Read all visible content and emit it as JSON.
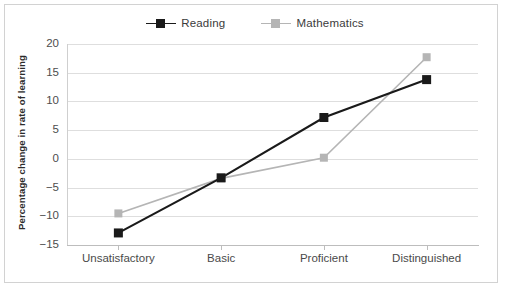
{
  "chart_data": {
    "type": "line",
    "title": "",
    "xlabel": "",
    "ylabel": "Percentage change in rate of learning",
    "categories": [
      "Unsatisfactory",
      "Basic",
      "Proficient",
      "Distinguished"
    ],
    "series": [
      {
        "name": "Reading",
        "color": "#1a1a1a",
        "values": [
          -12.9,
          -3.3,
          7.2,
          13.8
        ]
      },
      {
        "name": "Mathematics",
        "color": "#b5b5b5",
        "values": [
          -9.5,
          -3.4,
          0.2,
          17.7
        ]
      }
    ],
    "ylim": [
      -15,
      20
    ],
    "yticks": [
      20,
      15,
      10,
      5,
      0,
      -5,
      -10,
      -15
    ],
    "ytick_labels": [
      "20",
      "15",
      "10",
      "5",
      "0",
      "−5",
      "−10",
      "−15"
    ],
    "grid": true,
    "legend_position": "top-center",
    "marker": "square"
  },
  "legend": {
    "items": [
      {
        "label": "Reading",
        "color": "#1a1a1a"
      },
      {
        "label": "Mathematics",
        "color": "#b5b5b5"
      }
    ]
  },
  "frame": {
    "border_color": "#d2d2d2",
    "background": "#ffffff",
    "gridline_color": "#dedede",
    "axis_color": "#bdbdbd"
  }
}
